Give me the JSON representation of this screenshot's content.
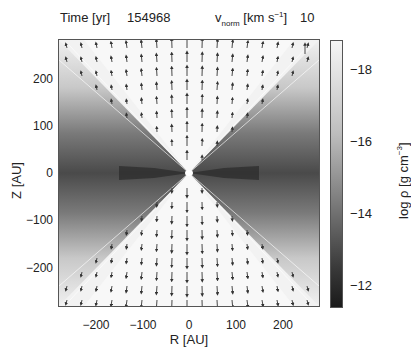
{
  "header": {
    "time_label": "Time [yr]",
    "time_value": "154968",
    "vnorm_symbol": "v",
    "vnorm_sub": "norm",
    "vnorm_unit_pre": " [km s",
    "vnorm_unit_sup": "−1",
    "vnorm_unit_post": "]",
    "vnorm_value": "10"
  },
  "axes": {
    "xlabel": "R [AU]",
    "ylabel": "Z [AU]",
    "xticks": [
      "−200",
      "−100",
      "0",
      "100",
      "200"
    ],
    "yticks": [
      "200",
      "100",
      "0",
      "−100",
      "−200"
    ]
  },
  "colorbar": {
    "label_pre": "log ρ [g cm",
    "label_sup": "−3",
    "label_post": "]",
    "ticks": [
      "−18",
      "−16",
      "−14",
      "−12"
    ],
    "range": [
      -11.5,
      -18.9
    ],
    "color_low": "#f4f4f4",
    "color_high": "#1a1a1a"
  },
  "chart_data": {
    "type": "heatmap",
    "xlabel": "R [AU]",
    "ylabel": "Z [AU]",
    "xlim": [
      -280,
      280
    ],
    "ylim": [
      -280,
      280
    ],
    "xticks": [
      -200,
      -100,
      0,
      100,
      200
    ],
    "yticks": [
      -200,
      -100,
      0,
      100,
      200
    ],
    "colorbar": {
      "label": "log ρ [g cm^-3]",
      "ticks": [
        -18,
        -16,
        -14,
        -12
      ],
      "range": [
        -11.5,
        -18.9
      ],
      "colormap": "grayscale (dark = dense)"
    },
    "vector_field": {
      "reference_velocity_km_s": 10,
      "direction_upper_half": "up (+Z)",
      "direction_lower_half": "down (−Z)",
      "max_magnitude_near_axis": true
    }
  }
}
